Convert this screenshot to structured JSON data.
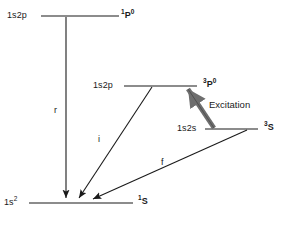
{
  "diagram": {
    "type": "energy-level-diagram",
    "background_color": "#ffffff",
    "line_color": "#1a1a1a",
    "excitation_arrow_color": "#6e6e6e",
    "levels": [
      {
        "id": "level-1s2p-singlet",
        "config_label": "1s2p",
        "term_pre_sup": "1",
        "term_letter": "P",
        "term_post_sup": "0",
        "term_text": "1P0"
      },
      {
        "id": "level-1s2p-triplet",
        "config_label": "1s2p",
        "term_pre_sup": "3",
        "term_letter": "P",
        "term_post_sup": "0",
        "term_text": "3P0"
      },
      {
        "id": "level-1s2s-triplet",
        "config_label": "1s2s",
        "term_pre_sup": "3",
        "term_letter": "S",
        "term_post_sup": "",
        "term_text": "3S"
      },
      {
        "id": "level-ground",
        "config_label": "1s2",
        "config_sup": "2",
        "term_pre_sup": "1",
        "term_letter": "S",
        "term_post_sup": "",
        "term_text": "1S"
      }
    ],
    "transitions": [
      {
        "id": "transition-r",
        "label": "r",
        "from": "level-1s2p-singlet",
        "to": "level-ground"
      },
      {
        "id": "transition-i",
        "label": "i",
        "from": "level-1s2p-triplet",
        "to": "level-ground"
      },
      {
        "id": "transition-f",
        "label": "f",
        "from": "level-1s2s-triplet",
        "to": "level-ground"
      }
    ],
    "excitation": {
      "id": "excitation-arrow",
      "label": "Excitation",
      "from": "level-1s2s-triplet",
      "to": "level-1s2p-triplet"
    }
  }
}
